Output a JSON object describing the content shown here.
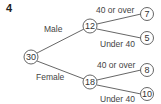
{
  "question_number": "4",
  "tree": {
    "root": {
      "value": "30"
    },
    "branches": [
      {
        "label": "Male",
        "node": {
          "value": "12"
        },
        "children": [
          {
            "label": "40 or over",
            "value": "7"
          },
          {
            "label": "Under 40",
            "value": "5"
          }
        ]
      },
      {
        "label": "Female",
        "node": {
          "value": "18"
        },
        "children": [
          {
            "label": "40 or over",
            "value": "8"
          },
          {
            "label": "Under 40",
            "value": "10"
          }
        ]
      }
    ]
  }
}
